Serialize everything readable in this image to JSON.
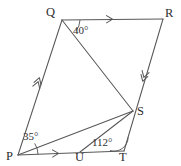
{
  "figure": {
    "stroke_color": "#58585a",
    "text_color": "#2e2e30",
    "background_color": "#ffffff",
    "width": 181,
    "height": 166
  },
  "vertices": [
    {
      "id": "Q",
      "label": "Q",
      "x": 62,
      "y": 20,
      "label_x": 46,
      "label_y": 6
    },
    {
      "id": "R",
      "label": "R",
      "x": 163,
      "y": 19,
      "label_x": 165,
      "label_y": 7
    },
    {
      "id": "S",
      "label": "S",
      "x": 133,
      "y": 111,
      "label_x": 137,
      "label_y": 105
    },
    {
      "id": "T",
      "label": "T",
      "x": 124,
      "y": 151,
      "label_x": 119,
      "label_y": 151
    },
    {
      "id": "U",
      "label": "U",
      "x": 80,
      "y": 152,
      "label_x": 75,
      "label_y": 152
    },
    {
      "id": "P",
      "label": "P",
      "x": 18,
      "y": 155,
      "label_x": 6,
      "label_y": 150
    }
  ],
  "segments": [
    {
      "name": "side-PQ",
      "from": "P",
      "to": "Q",
      "marks": 2
    },
    {
      "name": "side-QR",
      "from": "Q",
      "to": "R",
      "marks": 1
    },
    {
      "name": "side-RT",
      "from": "R",
      "to": "T",
      "marks": 2
    },
    {
      "name": "side-PT",
      "from": "P",
      "to": "T",
      "marks": 1
    },
    {
      "name": "diagonal-QS",
      "from": "Q",
      "to": "S",
      "marks": 0
    },
    {
      "name": "diagonal-PS",
      "from": "P",
      "to": "S",
      "marks": 0
    },
    {
      "name": "segment-US",
      "from": "U",
      "to": "S",
      "marks": 0
    }
  ],
  "angles": [
    {
      "id": "angle-Q",
      "value": "40°",
      "at_vertex": "Q",
      "between": [
        "QR",
        "QS"
      ],
      "label_x": 73,
      "label_y": 25
    },
    {
      "id": "angle-P",
      "value": "35°",
      "at_vertex": "P",
      "between": [
        "PU",
        "PS"
      ],
      "label_x": 23,
      "label_y": 131
    },
    {
      "id": "angle-T",
      "value": "112°",
      "at_vertex": "T",
      "between": [
        "TU",
        "TS"
      ],
      "label_x": 92,
      "label_y": 137
    }
  ],
  "tick_marks": [
    {
      "name": "arrow-mark-QR",
      "on": "side-QR",
      "chevrons": 1,
      "x": 110,
      "y": 19.2,
      "angle_deg": -0.6
    },
    {
      "name": "arrow-mark-PT",
      "on": "side-PT",
      "chevrons": 1,
      "x": 56,
      "y": 153.4,
      "angle_deg": -1.2
    },
    {
      "name": "arrow-mark-PQ",
      "on": "side-PQ",
      "chevrons": 2,
      "x": 38,
      "y": 82,
      "angle_deg": -72
    },
    {
      "name": "arrow-mark-RT",
      "on": "side-RT",
      "chevrons": 2,
      "x": 144,
      "y": 77,
      "angle_deg": 77
    }
  ]
}
